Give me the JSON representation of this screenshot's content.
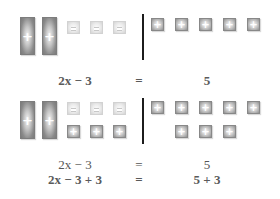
{
  "panels": [
    {
      "name": "initial",
      "left": {
        "x_tiles": 2,
        "minus_tiles": 3
      },
      "right": {
        "plus_tiles": 5
      },
      "equations": [
        {
          "lhs": "2x − 3",
          "op": "=",
          "rhs": "5"
        }
      ]
    },
    {
      "name": "add-three",
      "left": {
        "x_tiles": 2,
        "minus_tiles": 3,
        "added_plus_tiles": 3
      },
      "right": {
        "plus_tiles": 5,
        "added_plus_tiles": 3
      },
      "equations": [
        {
          "lhs": "2x − 3",
          "op": "=",
          "rhs": "5"
        },
        {
          "lhs": "2x − 3 + 3",
          "op": "=",
          "rhs": "5 + 3"
        }
      ]
    }
  ],
  "glyphs": {
    "plus": "+",
    "minus": "−"
  },
  "colors": {
    "x_tile": "#8a8a8a",
    "plus_tile": "#9a9a9a",
    "minus_tile": "#e0e0e0",
    "divider": "#1c1c1c",
    "text": "#555555"
  }
}
